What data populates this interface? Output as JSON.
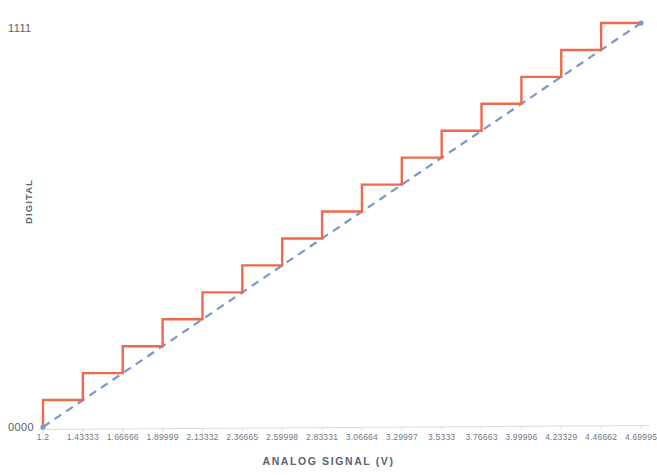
{
  "chart_data": {
    "type": "line",
    "title": "",
    "subtitle": "",
    "xlabel": "ANALOG SIGNAL (V)",
    "ylabel": "DIGITAL",
    "grid": false,
    "legend": "none",
    "xlim": [
      1.2,
      4.69995
    ],
    "ylim": [
      0,
      15
    ],
    "ytick_labels": [
      "0000",
      "1111"
    ],
    "ytick_values": [
      0,
      15
    ],
    "xtick_labels": [
      "1.2",
      "1.43333",
      "1.66666",
      "1.89999",
      "2.13332",
      "2.36665",
      "2.59998",
      "2.83331",
      "3.06664",
      "3.29997",
      "3.5333",
      "3.76663",
      "3.99996",
      "4.23329",
      "4.46662",
      "4.69995"
    ],
    "xtick_values": [
      1.2,
      1.43333,
      1.66666,
      1.89999,
      2.13332,
      2.36665,
      2.59998,
      2.83331,
      3.06664,
      3.29997,
      3.5333,
      3.76663,
      3.99996,
      4.23329,
      4.46662,
      4.69995
    ],
    "series": [
      {
        "name": "quantized-digital-output",
        "style": "step",
        "color": "#ED6A4C",
        "x": [
          1.2,
          1.43333,
          1.66666,
          1.89999,
          2.13332,
          2.36665,
          2.59998,
          2.83331,
          3.06664,
          3.29997,
          3.5333,
          3.76663,
          3.99996,
          4.23329,
          4.46662,
          4.69995
        ],
        "values": [
          0,
          1,
          2,
          3,
          4,
          5,
          6,
          7,
          8,
          9,
          10,
          11,
          12,
          13,
          14,
          15
        ],
        "digital_codes": [
          "0000",
          "0001",
          "0010",
          "0011",
          "0100",
          "0101",
          "0110",
          "0111",
          "1000",
          "1001",
          "1010",
          "1011",
          "1100",
          "1101",
          "1110",
          "1111"
        ]
      },
      {
        "name": "ideal-linear-reference",
        "style": "dashed-line",
        "color": "#7B96C8",
        "x": [
          1.2,
          4.69995
        ],
        "values": [
          0,
          15
        ]
      }
    ],
    "annotations": []
  },
  "axes": {
    "y_top_code": "1111",
    "y_bottom_code": "0000",
    "y_title": "DIGITAL",
    "x_title": "ANALOG SIGNAL (V)"
  },
  "colors": {
    "step_line": "#ED6A4C",
    "reference_line": "#7B96C8",
    "axis_line": "#D9DCE0",
    "tick_text": "#707a86",
    "title_text": "#5a6472",
    "background": "#ffffff"
  }
}
